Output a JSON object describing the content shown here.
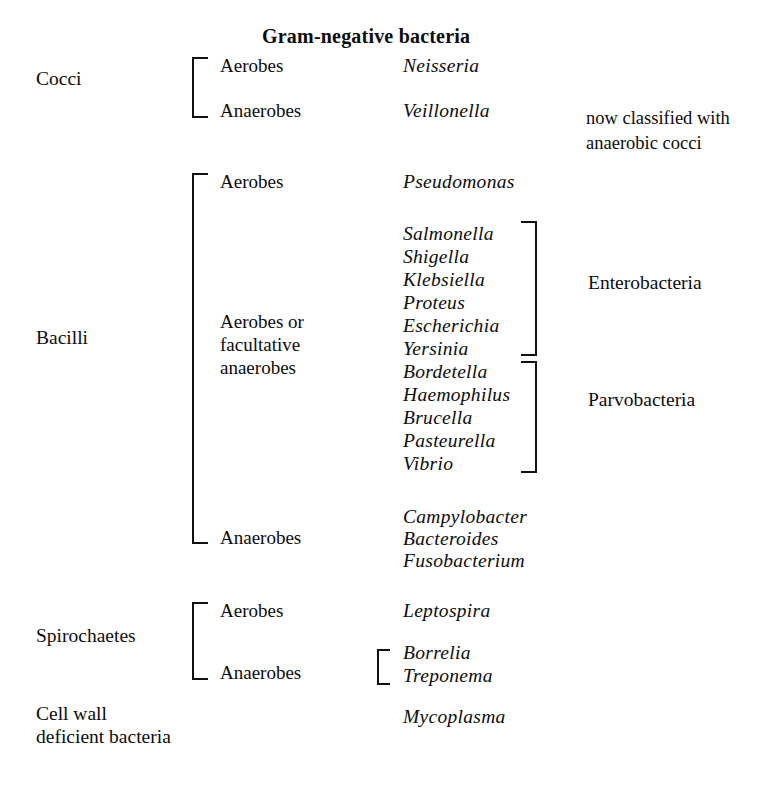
{
  "title": "Gram-negative bacteria",
  "categories": [
    {
      "label": "Cocci"
    },
    {
      "label": "Bacilli"
    },
    {
      "label": "Spirochaetes"
    },
    {
      "label": "Cell wall",
      "label2": "deficient bacteria"
    }
  ],
  "oxygen_labels": {
    "cocci_aerobes": "Aerobes",
    "cocci_anaerobes": "Anaerobes",
    "bacilli_aerobes": "Aerobes",
    "bacilli_facultative_line1": "Aerobes or",
    "bacilli_facultative_line2": "facultative",
    "bacilli_facultative_line3": "anaerobes",
    "bacilli_anaerobes": "Anaerobes",
    "spiro_aerobes": "Aerobes",
    "spiro_anaerobes": "Anaerobes"
  },
  "genera": {
    "cocci_aerobes": "Neisseria",
    "cocci_anaerobes": "Veillonella",
    "bacilli_aerobes": "Pseudomonas",
    "enterobacteria": [
      "Salmonella",
      "Shigella",
      "Klebsiella",
      "Proteus",
      "Escherichia",
      "Yersinia"
    ],
    "parvobacteria": [
      "Bordetella",
      "Haemophilus",
      "Brucella",
      "Pasteurella",
      "Vibrio"
    ],
    "bacilli_anaerobes": [
      "Campylobacter",
      "Bacteroides",
      "Fusobacterium"
    ],
    "spiro_aerobes": "Leptospira",
    "spiro_anaerobes": [
      "Borrelia",
      "Treponema"
    ],
    "cell_wall_deficient": "Mycoplasma"
  },
  "group_labels": {
    "enterobacteria": "Enterobacteria",
    "parvobacteria": "Parvobacteria"
  },
  "notes": {
    "veillonella_line1": "now classified with",
    "veillonella_line2": "anaerobic cocci"
  },
  "colors": {
    "ink": "#0c0c0c",
    "rule": "#111111",
    "background": "#ffffff"
  }
}
